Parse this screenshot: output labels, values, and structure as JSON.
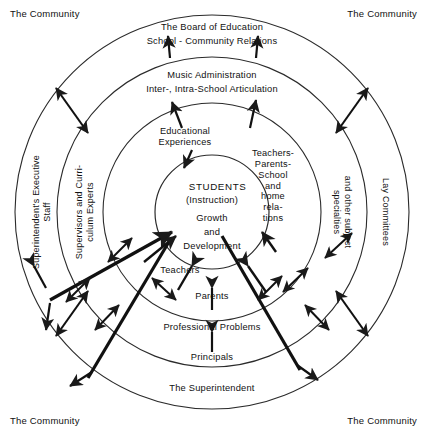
{
  "diagram": {
    "type": "concentric-circles",
    "center": {
      "x": 212,
      "y": 212
    },
    "background_color": "#ffffff",
    "line_color": "#1a1a1a",
    "text_color": "#111111",
    "rings": [
      {
        "index": 0,
        "radius": 197,
        "name": "community-ring"
      },
      {
        "index": 1,
        "radius": 155,
        "name": "board-of-education-ring"
      },
      {
        "index": 2,
        "radius": 109,
        "name": "music-administration-ring"
      },
      {
        "index": 3,
        "radius": 57,
        "name": "students-core"
      }
    ],
    "corners": {
      "top_left": "The Community",
      "top_right": "The Community",
      "bottom_left": "The Community",
      "bottom_right": "The Community"
    },
    "ring_labels": {
      "board_line1": "The Board of Education",
      "board_line2": "School - Community Relations",
      "music_line1": "Music Administration",
      "music_line2": "Inter-, Intra-School Articulation",
      "educational_experiences": "Educational\nExperiences",
      "teachers_parents_school": "Teachers-\nParents-\nSchool\nand\nhome\nrela-\ntions",
      "superintendents_executive_staff": "Superintendent's Executive\nStaff",
      "supervisors_curriculum_experts": "Supervisors and Curri-\nculum Experts",
      "lay_committees": "Lay Committees",
      "other_subject_specialties": "and other subject\nspecialties"
    },
    "core": {
      "students": "STUDENTS",
      "instruction": "(Instruction)",
      "growth": "Growth",
      "and": "and",
      "development": "Development"
    },
    "bottom_labels": {
      "teachers": "Teachers",
      "parents": "Parents",
      "professional_problems": "Professional Problems",
      "principals": "Principals",
      "the_superintendent": "The Superintendent"
    }
  }
}
